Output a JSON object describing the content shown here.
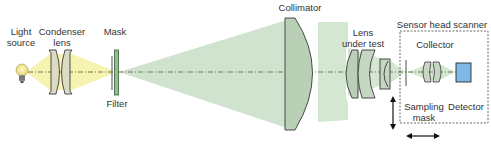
{
  "diagram": {
    "labels": {
      "light_source_1": "Light",
      "light_source_2": "source",
      "condenser_1": "Condenser",
      "condenser_2": "lens",
      "mask": "Mask",
      "filter": "Filter",
      "collimator": "Collimator",
      "lens_under_test_1": "Lens",
      "lens_under_test_2": "under test",
      "sensor_head_scanner": "Sensor head scanner",
      "collector": "Collector",
      "sampling_mask_1": "Sampling",
      "sampling_mask_2": "mask",
      "detector": "Detector"
    },
    "colors": {
      "yellow_beam": "#f6f2a6",
      "green_beam": "#cfe4cf",
      "lens_fill": "#c8d6c4",
      "lens_stroke": "#3a3a3a",
      "detector_fill": "#7db8e6",
      "filter_fill": "#8fbf8f",
      "axis": "#555555"
    }
  }
}
